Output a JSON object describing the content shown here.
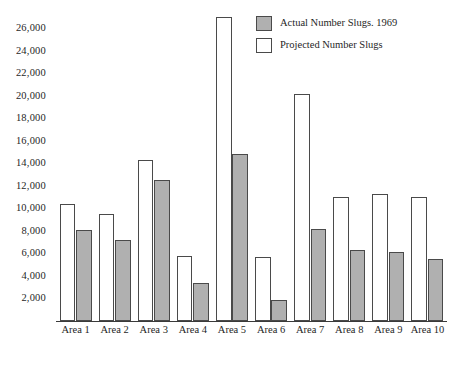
{
  "chart_data": {
    "type": "bar",
    "title": "",
    "subtitle": "",
    "xlabel": "",
    "ylabel": "",
    "grid": false,
    "legend_position": "top-right",
    "categories": [
      "Area 1",
      "Area 2",
      "Area 3",
      "Area 4",
      "Area 5",
      "Area 6",
      "Area 7",
      "Area 8",
      "Area 9",
      "Area 10"
    ],
    "ylim": [
      0,
      27800
    ],
    "yticks": [
      2000,
      4000,
      6000,
      8000,
      10000,
      12000,
      14000,
      16000,
      18000,
      20000,
      22000,
      24000,
      26000
    ],
    "ytick_labels": [
      "2,000",
      "4,000",
      "6,000",
      "8,000",
      "10,000",
      "12,000",
      "14,000",
      "16,000",
      "18,000",
      "20,000",
      "22,000",
      "24,000",
      "26,000"
    ],
    "series": [
      {
        "name": "Projected Number Slugs",
        "color": "#ffffff",
        "values": [
          10400,
          9500,
          14300,
          5800,
          27000,
          5700,
          20200,
          11000,
          11300,
          11000
        ]
      },
      {
        "name": "Actual Number Slugs. 1969",
        "color": "#b0b0b0",
        "values": [
          8100,
          7200,
          12500,
          3400,
          14800,
          1900,
          8200,
          6300,
          6100,
          5500
        ]
      }
    ]
  },
  "legend": {
    "items": [
      {
        "label": "Actual Number Slugs. 1969",
        "swatch": "actual"
      },
      {
        "label": "Projected Number Slugs",
        "swatch": "projected"
      }
    ]
  }
}
